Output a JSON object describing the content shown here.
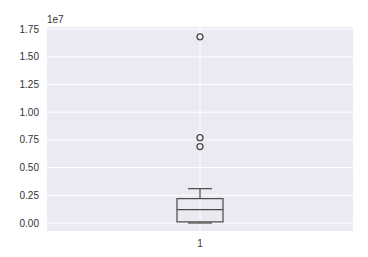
{
  "chart_data": {
    "type": "box",
    "title": "",
    "xlabel": "",
    "ylabel": "",
    "categories": [
      "1"
    ],
    "y_offset_label": "1e7",
    "y_scale": 10000000,
    "ylim": [
      -0.05,
      1.8
    ],
    "yticks": [
      0.0,
      0.25,
      0.5,
      0.75,
      1.0,
      1.25,
      1.5,
      1.75
    ],
    "ytick_labels": [
      "0.00",
      "0.25",
      "0.50",
      "0.75",
      "1.00",
      "1.25",
      "1.50",
      "1.75"
    ],
    "grid": true,
    "style": "seaborn-whitegrid-gray",
    "boxes": [
      {
        "label": "1",
        "whisker_low": 0.0,
        "q1": 0.01,
        "median": 0.12,
        "q3": 0.22,
        "whisker_high": 0.31,
        "outliers": [
          1.68,
          0.77,
          0.69
        ]
      }
    ]
  },
  "colors": {
    "plot_background": "#eaeaf2",
    "grid": "#ffffff",
    "box_line": "#4a4a4a",
    "median_line": "#4a4a4a",
    "outlier_edge": "#4a4a4a",
    "text": "#333333"
  }
}
